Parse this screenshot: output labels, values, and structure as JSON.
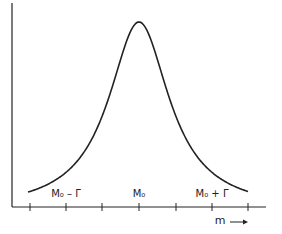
{
  "chart_data": {
    "type": "line",
    "title": "",
    "xlabel": "m",
    "ylabel": "",
    "curve": "Lorentzian (Breit-Wigner) resonance peak",
    "peak_x_label": "M₀",
    "tick_labels": [
      {
        "position": 1,
        "text": "M₀ − Γ"
      },
      {
        "position": 3,
        "text": "M₀"
      },
      {
        "position": 5,
        "text": "M₀ + Γ"
      }
    ],
    "num_ticks": 7,
    "grid": false,
    "legend": null
  },
  "labels": {
    "left": "M₀ – Γ",
    "center": "M₀",
    "right": "M₀ + Γ",
    "axis": "m",
    "arrow": "→"
  },
  "colors": {
    "ink": "#222222",
    "background": "#ffffff"
  }
}
